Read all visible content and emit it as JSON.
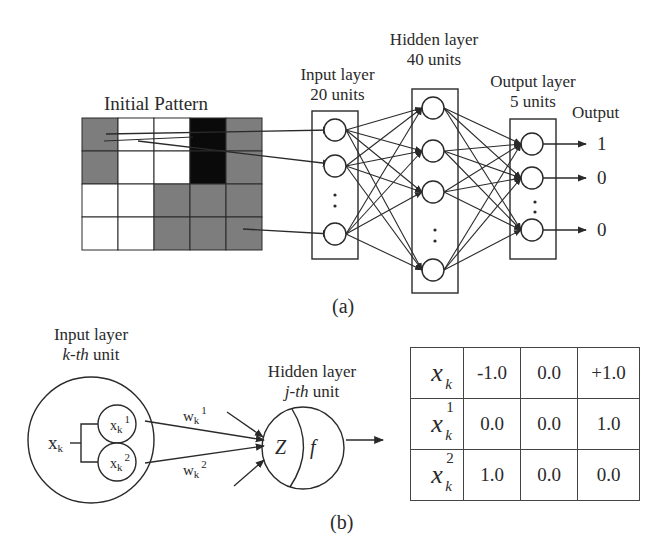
{
  "panel_a": {
    "caption": "(a)",
    "pattern": {
      "title": "Initial Pattern",
      "rows": 4,
      "cols": 5,
      "cells": [
        [
          "gray",
          "white",
          "white",
          "black",
          "gray"
        ],
        [
          "gray",
          "white",
          "white",
          "black",
          "gray"
        ],
        [
          "white",
          "white",
          "gray",
          "gray",
          "gray"
        ],
        [
          "white",
          "white",
          "gray",
          "gray",
          "gray"
        ]
      ]
    },
    "input_layer": {
      "title": "Input layer",
      "units": "20 units",
      "ellipsis": ":"
    },
    "hidden_layer": {
      "title": "Hidden layer",
      "units": "40 units",
      "ellipsis": ":"
    },
    "output_layer": {
      "title": "Output layer",
      "units": "5 units",
      "ellipsis": ":"
    },
    "output": {
      "title": "Output",
      "values": [
        "1",
        "0",
        "0"
      ]
    }
  },
  "panel_b": {
    "caption": "(b)",
    "input_unit": {
      "title": "Input layer",
      "subtitle_italic": "k-th",
      "subtitle_rest": " unit",
      "x_main": "x",
      "x_main_sub": "k",
      "x1": {
        "base": "x",
        "sub": "k",
        "sup": "1"
      },
      "x2": {
        "base": "x",
        "sub": "k",
        "sup": "2"
      },
      "w1": {
        "base": "w",
        "sub": "k",
        "sup": "1"
      },
      "w2": {
        "base": "w",
        "sub": "k",
        "sup": "2"
      }
    },
    "hidden_unit": {
      "title": "Hidden layer",
      "subtitle_italic": "j-th",
      "subtitle_rest": " unit",
      "z_label": "Z",
      "f_label": "f"
    },
    "encoding_table": {
      "rows": [
        {
          "label": "x",
          "sub": "k",
          "sup": "",
          "values": [
            "-1.0",
            "0.0",
            "+1.0"
          ]
        },
        {
          "label": "x",
          "sub": "k",
          "sup": "1",
          "values": [
            "0.0",
            "0.0",
            "1.0"
          ]
        },
        {
          "label": "x",
          "sub": "k",
          "sup": "2",
          "values": [
            "1.0",
            "0.0",
            "0.0"
          ]
        }
      ]
    }
  },
  "colors": {
    "gray_cell": "#7d7d7d",
    "black_cell": "#0a0a0a",
    "line": "#2a2a2a"
  }
}
